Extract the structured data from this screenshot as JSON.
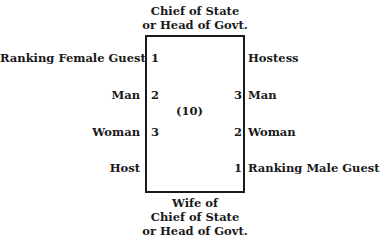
{
  "diagram": {
    "head_top": [
      "Chief of State",
      "or Head of Govt."
    ],
    "head_bottom": [
      "Wife of",
      "Chief of State",
      "or Head of Govt."
    ],
    "table_count": "(10)",
    "left_side": [
      {
        "label": "Ranking Female Guest",
        "number": "1"
      },
      {
        "label": "Man",
        "number": "2"
      },
      {
        "label": "Woman",
        "number": "3"
      },
      {
        "label": "Host",
        "number": ""
      }
    ],
    "right_side": [
      {
        "label": "Hostess",
        "number": ""
      },
      {
        "label": "Man",
        "number": "3"
      },
      {
        "label": "Woman",
        "number": "2"
      },
      {
        "label": "Ranking Male Guest",
        "number": "1"
      }
    ]
  }
}
